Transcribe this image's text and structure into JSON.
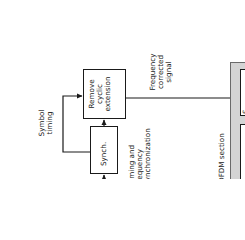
{
  "diagram": {
    "blocks": {
      "remove_cyclic": {
        "lines": [
          "Remove",
          "cyclic",
          "extension"
        ]
      },
      "synch": {
        "label": "Synch."
      },
      "serial_partial": {
        "label": "S"
      }
    },
    "labels": {
      "symbol_timing": [
        "Symbol",
        "timing"
      ],
      "frequency_corrected": [
        "Frequency",
        "corrected",
        "signal"
      ],
      "timing_frequency_sync": [
        "Timing and",
        "frequency",
        "synchronization"
      ],
      "ofdm_section": "OFDM section"
    },
    "colors": {
      "line": "#1a1a1a",
      "section_fill": "#d4d4d4",
      "block_fill": "#ffffff"
    },
    "orientation": "rotated -90deg"
  }
}
